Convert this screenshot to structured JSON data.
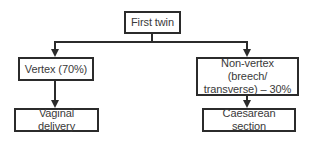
{
  "diagram": {
    "type": "flowchart",
    "colors": {
      "line": "#2b2b2b",
      "text": "#3a3a3a",
      "background": "#ffffff"
    },
    "nodes": {
      "root": {
        "label": "First twin"
      },
      "vertex": {
        "label": "Vertex (70%)"
      },
      "non_vertex": {
        "line1": "Non-vertex (breech/",
        "line2": "transverse) – 30%"
      },
      "vaginal": {
        "label": "Vaginal delivery"
      },
      "caesarean": {
        "label": "Caesarean section"
      }
    },
    "edges": [
      {
        "from": "First twin",
        "to": "Vertex (70%)"
      },
      {
        "from": "First twin",
        "to": "Non-vertex (breech/transverse) – 30%"
      },
      {
        "from": "Vertex (70%)",
        "to": "Vaginal delivery"
      },
      {
        "from": "Non-vertex (breech/transverse) – 30%",
        "to": "Caesarean section"
      }
    ]
  }
}
